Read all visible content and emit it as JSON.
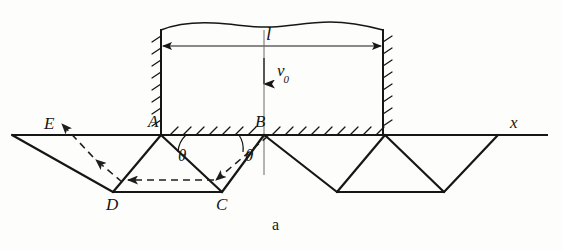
{
  "figure": {
    "caption": "a",
    "type": "physics-diagram"
  },
  "labels": {
    "length": "l",
    "velocity": "v",
    "velocity_sub": "0",
    "axis": "x",
    "angle_left": "θ",
    "angle_right": "θ",
    "point_A": "A",
    "point_B": "B",
    "point_C": "C",
    "point_D": "D",
    "point_E": "E"
  },
  "geometry": {
    "axis_y": 135,
    "axis_x_start": 12,
    "axis_x_end": 548,
    "wall_left_x": 161,
    "wall_right_x": 383,
    "wall_top_y": 28,
    "dimension_y": 46,
    "valley_y": 192,
    "points": {
      "E": [
        12,
        135
      ],
      "A": [
        161,
        135
      ],
      "B": [
        264,
        135
      ],
      "C": [
        222,
        192
      ],
      "D": [
        113,
        192
      ]
    },
    "teeth_axis_nodes": [
      12,
      161,
      264,
      385,
      498
    ],
    "teeth_valley_nodes": [
      113,
      222,
      337,
      444
    ],
    "velocity_arrow": {
      "x": 264,
      "y_top": 58,
      "y_bottom": 86
    },
    "center_line": {
      "x": 264,
      "y_top": 30,
      "y_bottom": 175
    }
  },
  "colors": {
    "ink": "#161616",
    "background": "#fdfdfb",
    "dashed": "#2a2a2a"
  }
}
